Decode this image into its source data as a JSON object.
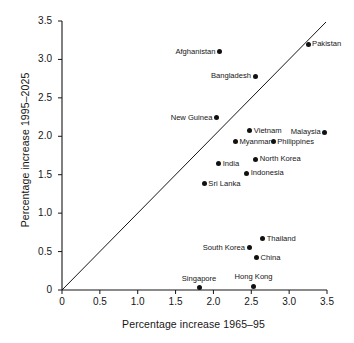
{
  "chart_data": {
    "type": "scatter",
    "title": "",
    "xlabel": "Percentage increase 1965–95",
    "ylabel": "Percentage increase 1995–2025",
    "xlim": [
      0,
      3.5
    ],
    "ylim": [
      0,
      3.5
    ],
    "grid": false,
    "legend": "none",
    "xticks": [
      "0",
      "0.5",
      "1.0",
      "1.5",
      "2.0",
      "2.5",
      "3.0",
      "3.5"
    ],
    "xtick_values": [
      0,
      0.5,
      1.0,
      1.5,
      2.0,
      2.5,
      3.0,
      3.5
    ],
    "yticks": [
      "0",
      "0.5",
      "1.0",
      "1.5",
      "2.0",
      "2.5",
      "3.0",
      "3.5"
    ],
    "ytick_values": [
      0,
      0.5,
      1.0,
      1.5,
      2.0,
      2.5,
      3.0,
      3.5
    ],
    "annotations": [
      {
        "text": "reference line y = x",
        "type": "line",
        "from": [
          0,
          0
        ],
        "to": [
          3.5,
          3.5
        ]
      }
    ],
    "marker_color": "#111111",
    "axis_color": "#161616",
    "points": [
      {
        "label": "Pakistan",
        "x": 3.25,
        "y": 3.2,
        "label_pos": "right"
      },
      {
        "label": "Afghanistan",
        "x": 2.08,
        "y": 3.1,
        "label_pos": "left"
      },
      {
        "label": "Bangladesh",
        "x": 2.55,
        "y": 2.78,
        "label_pos": "left"
      },
      {
        "label": "New Guinea",
        "x": 2.04,
        "y": 2.24,
        "label_pos": "left"
      },
      {
        "label": "Vietnam",
        "x": 2.48,
        "y": 2.07,
        "label_pos": "right"
      },
      {
        "label": "Malaysia",
        "x": 3.47,
        "y": 2.05,
        "label_pos": "left"
      },
      {
        "label": "Myanmar",
        "x": 2.29,
        "y": 1.93,
        "label_pos": "right"
      },
      {
        "label": "Philippines",
        "x": 2.79,
        "y": 1.93,
        "label_pos": "right"
      },
      {
        "label": "North Korea",
        "x": 2.56,
        "y": 1.7,
        "label_pos": "right"
      },
      {
        "label": "India",
        "x": 2.07,
        "y": 1.64,
        "label_pos": "right"
      },
      {
        "label": "Indonesia",
        "x": 2.44,
        "y": 1.52,
        "label_pos": "right"
      },
      {
        "label": "Sri Lanka",
        "x": 1.88,
        "y": 1.38,
        "label_pos": "right"
      },
      {
        "label": "Thailand",
        "x": 2.65,
        "y": 0.67,
        "label_pos": "right"
      },
      {
        "label": "South Korea",
        "x": 2.47,
        "y": 0.55,
        "label_pos": "left"
      },
      {
        "label": "China",
        "x": 2.57,
        "y": 0.42,
        "label_pos": "right"
      },
      {
        "label": "Hong Kong",
        "x": 2.53,
        "y": 0.05,
        "label_pos": "above"
      },
      {
        "label": "Singapore",
        "x": 1.81,
        "y": 0.03,
        "label_pos": "above"
      }
    ]
  }
}
